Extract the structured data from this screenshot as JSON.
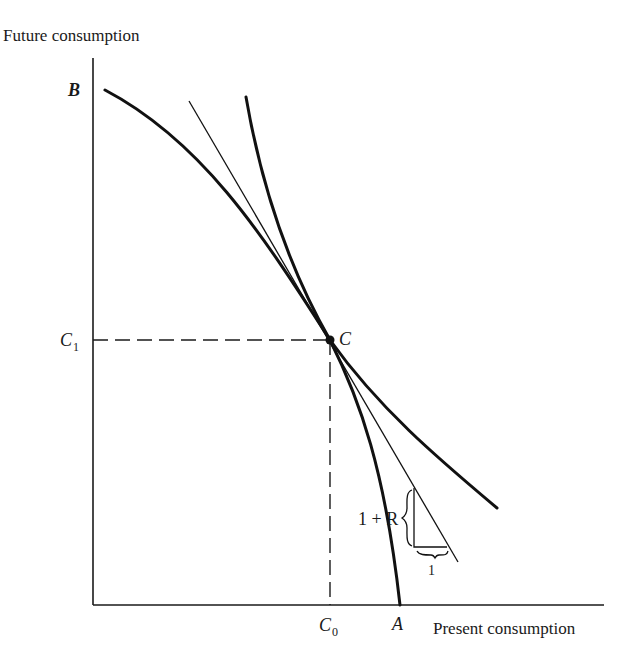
{
  "diagram": {
    "axes": {
      "y_label": "Future consumption",
      "x_label": "Present consumption"
    },
    "points": {
      "B": "B",
      "A": "A",
      "C": "C",
      "C1": {
        "base": "C",
        "sub": "1"
      },
      "C0": {
        "base": "C",
        "sub": "0"
      }
    },
    "slope_annotation": {
      "rise": "1 + R",
      "run": "1"
    },
    "colors": {
      "ink": "#111111",
      "background": "#ffffff"
    }
  }
}
